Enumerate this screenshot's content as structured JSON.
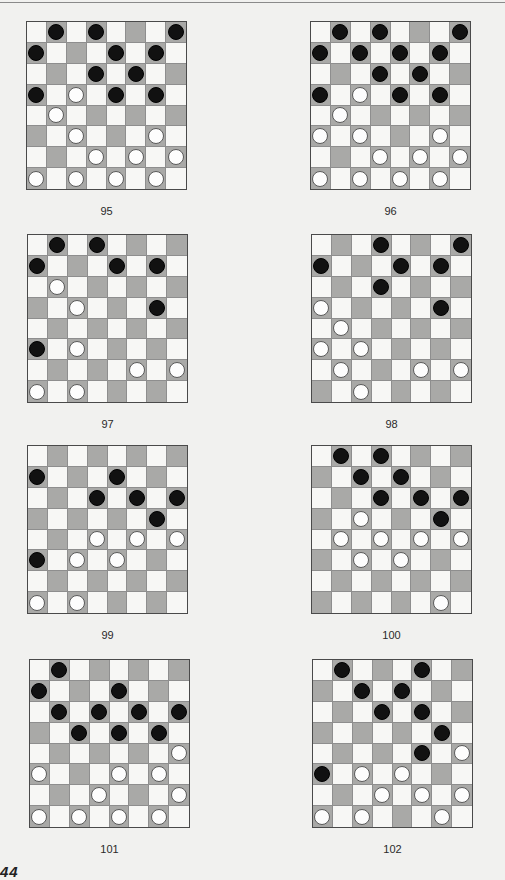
{
  "page": {
    "page_number": "44",
    "colors": {
      "dark_square": "#a9a9a7",
      "light_square": "#f7f7f5",
      "black_piece": "#111111",
      "white_piece": "#fdfdfd"
    }
  },
  "diagrams": [
    {
      "label": "95",
      "x": 26,
      "y": 21,
      "black": [
        [
          0,
          1
        ],
        [
          0,
          3
        ],
        [
          0,
          7
        ],
        [
          1,
          0
        ],
        [
          1,
          4
        ],
        [
          1,
          6
        ],
        [
          2,
          3
        ],
        [
          2,
          5
        ],
        [
          3,
          0
        ],
        [
          3,
          4
        ],
        [
          3,
          6
        ]
      ],
      "white": [
        [
          3,
          2
        ],
        [
          4,
          1
        ],
        [
          5,
          2
        ],
        [
          5,
          6
        ],
        [
          6,
          3
        ],
        [
          6,
          5
        ],
        [
          6,
          7
        ],
        [
          7,
          0
        ],
        [
          7,
          2
        ],
        [
          7,
          4
        ],
        [
          7,
          6
        ]
      ]
    },
    {
      "label": "96",
      "x": 310,
      "y": 21,
      "black": [
        [
          0,
          1
        ],
        [
          0,
          3
        ],
        [
          0,
          7
        ],
        [
          1,
          0
        ],
        [
          1,
          2
        ],
        [
          1,
          4
        ],
        [
          1,
          6
        ],
        [
          2,
          3
        ],
        [
          2,
          5
        ],
        [
          3,
          0
        ],
        [
          3,
          4
        ],
        [
          3,
          6
        ]
      ],
      "white": [
        [
          3,
          2
        ],
        [
          4,
          1
        ],
        [
          5,
          0
        ],
        [
          5,
          2
        ],
        [
          5,
          6
        ],
        [
          6,
          3
        ],
        [
          6,
          5
        ],
        [
          6,
          7
        ],
        [
          7,
          0
        ],
        [
          7,
          2
        ],
        [
          7,
          4
        ],
        [
          7,
          6
        ]
      ]
    },
    {
      "label": "97",
      "x": 27,
      "y": 234,
      "black": [
        [
          0,
          1
        ],
        [
          0,
          3
        ],
        [
          1,
          0
        ],
        [
          1,
          4
        ],
        [
          1,
          6
        ],
        [
          3,
          6
        ],
        [
          5,
          0
        ]
      ],
      "white": [
        [
          2,
          1
        ],
        [
          3,
          2
        ],
        [
          5,
          2
        ],
        [
          6,
          5
        ],
        [
          6,
          7
        ],
        [
          7,
          0
        ],
        [
          7,
          2
        ]
      ]
    },
    {
      "label": "98",
      "x": 311,
      "y": 234,
      "black": [
        [
          0,
          3
        ],
        [
          0,
          7
        ],
        [
          1,
          0
        ],
        [
          1,
          4
        ],
        [
          1,
          6
        ],
        [
          2,
          3
        ],
        [
          3,
          6
        ]
      ],
      "white": [
        [
          3,
          0
        ],
        [
          4,
          1
        ],
        [
          5,
          0
        ],
        [
          5,
          2
        ],
        [
          6,
          1
        ],
        [
          6,
          5
        ],
        [
          6,
          7
        ],
        [
          7,
          2
        ]
      ]
    },
    {
      "label": "99",
      "x": 27,
      "y": 445,
      "black": [
        [
          1,
          0
        ],
        [
          1,
          4
        ],
        [
          2,
          3
        ],
        [
          2,
          5
        ],
        [
          2,
          7
        ],
        [
          3,
          6
        ],
        [
          5,
          0
        ]
      ],
      "white": [
        [
          4,
          3
        ],
        [
          4,
          5
        ],
        [
          4,
          7
        ],
        [
          5,
          2
        ],
        [
          5,
          4
        ],
        [
          7,
          0
        ],
        [
          7,
          2
        ]
      ]
    },
    {
      "label": "100",
      "x": 311,
      "y": 445,
      "black": [
        [
          0,
          1
        ],
        [
          0,
          3
        ],
        [
          1,
          2
        ],
        [
          1,
          4
        ],
        [
          2,
          3
        ],
        [
          2,
          5
        ],
        [
          2,
          7
        ],
        [
          3,
          6
        ]
      ],
      "white": [
        [
          3,
          2
        ],
        [
          4,
          1
        ],
        [
          4,
          3
        ],
        [
          4,
          5
        ],
        [
          4,
          7
        ],
        [
          5,
          2
        ],
        [
          5,
          4
        ],
        [
          7,
          6
        ]
      ]
    },
    {
      "label": "101",
      "x": 29,
      "y": 659,
      "black": [
        [
          0,
          1
        ],
        [
          1,
          0
        ],
        [
          1,
          4
        ],
        [
          2,
          1
        ],
        [
          2,
          3
        ],
        [
          2,
          5
        ],
        [
          2,
          7
        ],
        [
          3,
          2
        ],
        [
          3,
          4
        ],
        [
          3,
          6
        ]
      ],
      "white": [
        [
          4,
          7
        ],
        [
          5,
          0
        ],
        [
          5,
          4
        ],
        [
          5,
          6
        ],
        [
          6,
          3
        ],
        [
          6,
          7
        ],
        [
          7,
          0
        ],
        [
          7,
          2
        ],
        [
          7,
          4
        ],
        [
          7,
          6
        ]
      ]
    },
    {
      "label": "102",
      "x": 312,
      "y": 659,
      "black": [
        [
          0,
          1
        ],
        [
          0,
          5
        ],
        [
          1,
          2
        ],
        [
          1,
          4
        ],
        [
          2,
          3
        ],
        [
          2,
          5
        ],
        [
          3,
          6
        ],
        [
          4,
          5
        ],
        [
          5,
          0
        ]
      ],
      "white": [
        [
          4,
          7
        ],
        [
          5,
          2
        ],
        [
          5,
          4
        ],
        [
          6,
          3
        ],
        [
          6,
          5
        ],
        [
          6,
          7
        ],
        [
          7,
          0
        ],
        [
          7,
          2
        ],
        [
          7,
          6
        ]
      ]
    }
  ]
}
